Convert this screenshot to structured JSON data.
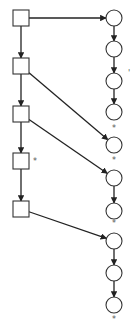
{
  "diagram": {
    "type": "directed-graph",
    "colors": {
      "stroke": "#333333",
      "background": "#ffffff"
    },
    "squares": [
      {
        "id": "s1",
        "cx": 21,
        "cy": 18,
        "mark": ""
      },
      {
        "id": "s2",
        "cx": 21,
        "cy": 66,
        "mark": ""
      },
      {
        "id": "s3",
        "cx": 21,
        "cy": 114,
        "mark": ""
      },
      {
        "id": "s4",
        "cx": 21,
        "cy": 161,
        "mark": "*"
      },
      {
        "id": "s5",
        "cx": 21,
        "cy": 209,
        "mark": ""
      }
    ],
    "circles": [
      {
        "id": "c1",
        "cx": 114,
        "cy": 18,
        "mark": ""
      },
      {
        "id": "c2",
        "cx": 114,
        "cy": 49,
        "mark": ""
      },
      {
        "id": "c3",
        "cx": 114,
        "cy": 81,
        "mark": "'"
      },
      {
        "id": "c4",
        "cx": 114,
        "cy": 112,
        "mark": "*"
      },
      {
        "id": "c5",
        "cx": 114,
        "cy": 145,
        "mark": "*"
      },
      {
        "id": "c6",
        "cx": 114,
        "cy": 178,
        "mark": ""
      },
      {
        "id": "c7",
        "cx": 114,
        "cy": 211,
        "mark": "*"
      },
      {
        "id": "c8",
        "cx": 114,
        "cy": 241,
        "mark": ""
      },
      {
        "id": "c9",
        "cx": 114,
        "cy": 273,
        "mark": ""
      },
      {
        "id": "c10",
        "cx": 114,
        "cy": 305,
        "mark": "*"
      }
    ],
    "edges": [
      [
        "s1",
        "s2"
      ],
      [
        "s2",
        "s3"
      ],
      [
        "s3",
        "s4"
      ],
      [
        "s4",
        "s5"
      ],
      [
        "c1",
        "c2"
      ],
      [
        "c2",
        "c3"
      ],
      [
        "c3",
        "c4"
      ],
      [
        "c6",
        "c7"
      ],
      [
        "c8",
        "c9"
      ],
      [
        "c9",
        "c10"
      ],
      [
        "s1",
        "c1"
      ],
      [
        "s2",
        "c5"
      ],
      [
        "s3",
        "c6"
      ],
      [
        "s5",
        "c8"
      ]
    ],
    "marks": {
      "star": "*",
      "tick": "'"
    }
  }
}
